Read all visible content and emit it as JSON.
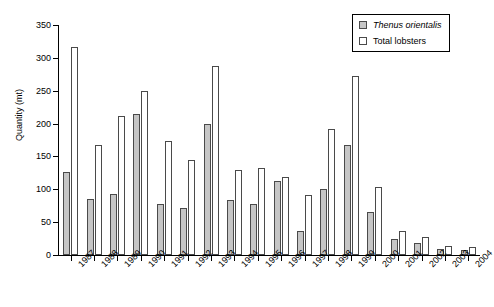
{
  "chart_data": {
    "type": "bar",
    "title": "",
    "xlabel": "",
    "ylabel": "Quantity (mt)",
    "ylim": [
      0,
      350
    ],
    "yticks": [
      0,
      50,
      100,
      150,
      200,
      250,
      300,
      350
    ],
    "grid": false,
    "legend_position": "top-right",
    "categories": [
      "1987",
      "1988",
      "1989",
      "1990",
      "1991",
      "1992",
      "1993",
      "1994",
      "1995",
      "1996",
      "1997",
      "1998",
      "1999",
      "2000",
      "2001",
      "2002",
      "2003",
      "2004"
    ],
    "series": [
      {
        "name": "Thenus orientalis",
        "style": "gray",
        "color": "#c6c6c6",
        "values": [
          127,
          86,
          93,
          214,
          77,
          71,
          200,
          83,
          78,
          112,
          37,
          100,
          167,
          65,
          25,
          18,
          9,
          7
        ]
      },
      {
        "name": "Total lobsters",
        "style": "white",
        "color": "#ffffff",
        "values": [
          316,
          168,
          211,
          249,
          173,
          145,
          287,
          129,
          133,
          119,
          92,
          192,
          272,
          103,
          37,
          28,
          13,
          12
        ]
      }
    ]
  },
  "legend": {
    "items": [
      {
        "label": "Thenus orientalis",
        "swatch": "gray",
        "italic": true
      },
      {
        "label": "Total lobsters",
        "swatch": "white",
        "italic": false
      }
    ]
  },
  "axes": {
    "y_title": "Quantity (mt)"
  }
}
